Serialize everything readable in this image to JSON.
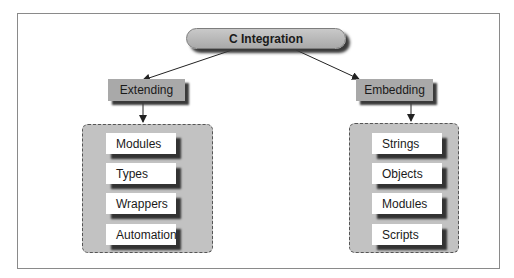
{
  "root": {
    "label": "C Integration"
  },
  "branches": [
    {
      "label": "Extending",
      "items": [
        "Modules",
        "Types",
        "Wrappers",
        "Automation"
      ]
    },
    {
      "label": "Embedding",
      "items": [
        "Strings",
        "Objects",
        "Modules",
        "Scripts"
      ]
    }
  ],
  "colors": {
    "node_fill": "#a9a9a9",
    "group_fill": "#c2c2c2",
    "item_fill": "#ffffff",
    "shadow": "#3a3a3a"
  }
}
